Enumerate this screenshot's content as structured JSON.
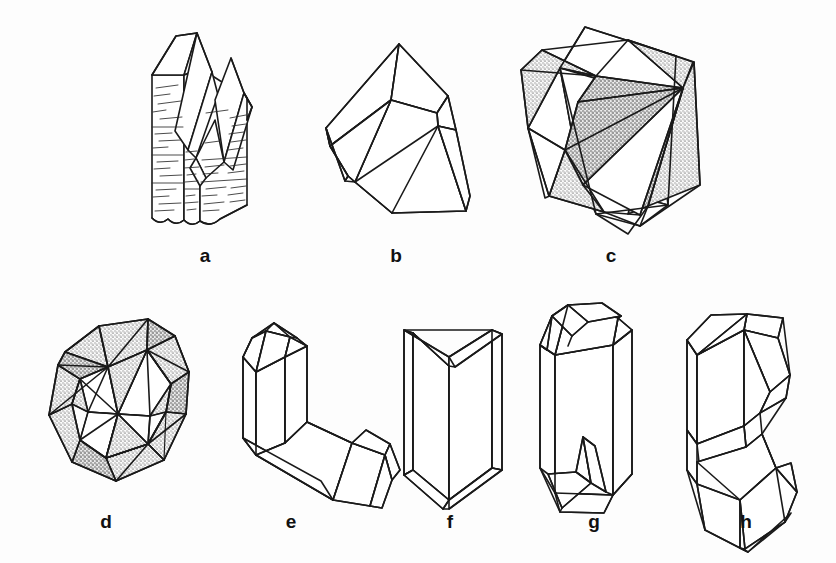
{
  "plate": {
    "width": 836,
    "height": 563,
    "background_color": "#fdfdfd",
    "line_color": "#1a1a1a",
    "shading_color": "#9a9a9a",
    "label_color": "#111111"
  },
  "figures": [
    {
      "id": "a",
      "label": "a",
      "label_x": 205,
      "label_y": 262,
      "description": "striated prismatic quartz crystal with two terminations",
      "shaded": false,
      "striated": true
    },
    {
      "id": "b",
      "label": "b",
      "label_x": 396,
      "label_y": 262,
      "description": "blocky wedge-shaped crystal, outline only",
      "shaded": false,
      "striated": false
    },
    {
      "id": "c",
      "label": "c",
      "label_x": 611,
      "label_y": 262,
      "description": "interpenetrant twin of two cubes with stippled faces",
      "shaded": true,
      "striated": false
    },
    {
      "id": "d",
      "label": "d",
      "label_x": 106,
      "label_y": 528,
      "description": "complex interpenetrant twin, stippled octahedral faces",
      "shaded": true,
      "striated": false
    },
    {
      "id": "e",
      "label": "e",
      "label_x": 291,
      "label_y": 528,
      "description": "two intergrown prismatic crystals at an angle",
      "shaded": false,
      "striated": false
    },
    {
      "id": "f",
      "label": "f",
      "label_x": 450,
      "label_y": 528,
      "description": "swallowtail V twin of two tabular crystals",
      "shaded": false,
      "striated": false
    },
    {
      "id": "g",
      "label": "g",
      "label_x": 594,
      "label_y": 528,
      "description": "prismatic crystal with re-entrant notched terminations",
      "shaded": false,
      "striated": false
    },
    {
      "id": "h",
      "label": "h",
      "label_x": 746,
      "label_y": 528,
      "description": "contact twin of two blocky crystals joined at waist",
      "shaded": false,
      "striated": false
    }
  ]
}
